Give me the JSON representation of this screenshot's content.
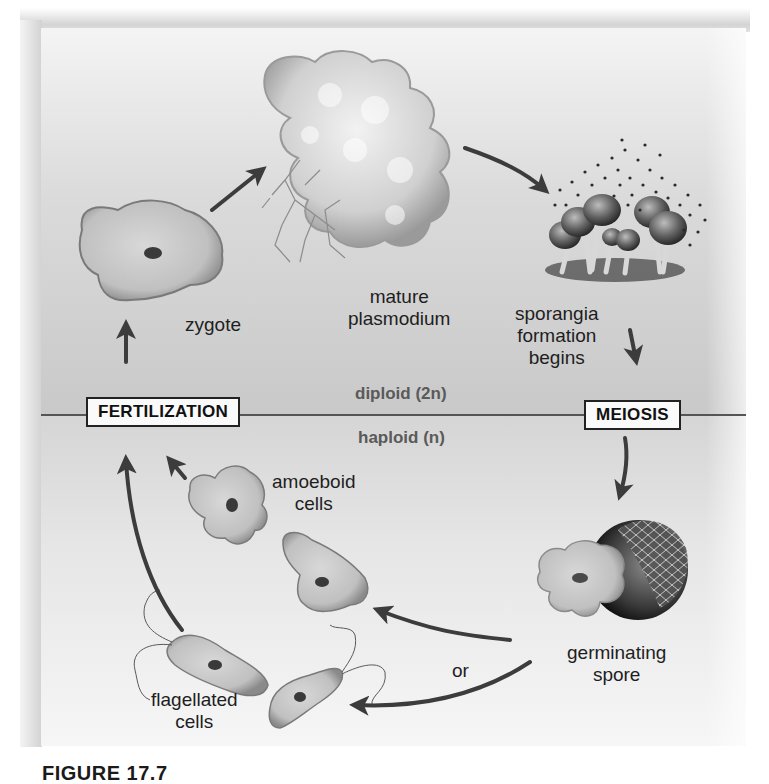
{
  "figure": {
    "type": "life-cycle-diagram",
    "caption_label": "FIGURE 17.7",
    "caption_text": "Life cycle of a plasmodial slime mold"
  },
  "zones": {
    "upper": "diploid (2n)",
    "lower": "haploid (n)"
  },
  "events": {
    "fertilization": "FERTILIZATION",
    "meiosis": "MEIOSIS"
  },
  "stages": {
    "zygote": "zygote",
    "plasmodium": [
      "mature",
      "plasmodium"
    ],
    "sporangia": [
      "sporangia",
      "formation",
      "begins"
    ],
    "spore": [
      "germinating",
      "spore"
    ],
    "amoeboid": [
      "amoeboid",
      "cells"
    ],
    "flagellated": [
      "flagellated",
      "cells"
    ],
    "or": "or"
  },
  "colors": {
    "arrow": "#3c3c3c",
    "cell_fill": "#c4c4c4",
    "cell_edge": "#7a7a7a",
    "nucleus": "#3a3a3a"
  }
}
